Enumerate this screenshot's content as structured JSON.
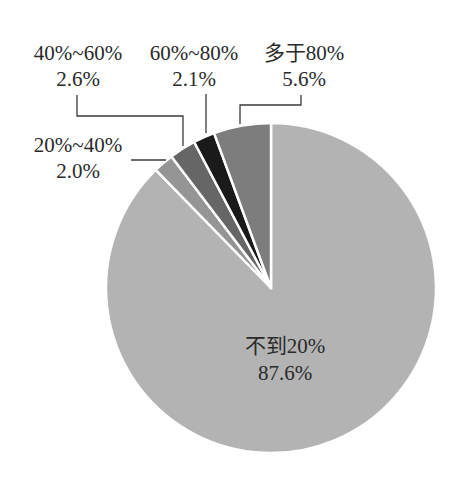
{
  "chart_data": {
    "type": "pie",
    "title": "",
    "start_angle_deg": 0,
    "direction": "clockwise",
    "categories": [
      "不到20%",
      "20%~40%",
      "40%~60%",
      "60%~80%",
      "多于80%"
    ],
    "values": [
      87.6,
      2.0,
      2.6,
      2.1,
      5.6
    ],
    "value_labels": [
      "87.6%",
      "2.0%",
      "2.6%",
      "2.1%",
      "5.6%"
    ],
    "colors": [
      "#b3b3b3",
      "#959595",
      "#666666",
      "#1a1a1a",
      "#7d7d7d"
    ],
    "legend": "none",
    "data_labels": "category and percent"
  },
  "labels": {
    "lt20": {
      "name": "不到20%",
      "pct": "87.6%"
    },
    "r20_40": {
      "name": "20%~40%",
      "pct": "2.0%"
    },
    "r40_60": {
      "name": "40%~60%",
      "pct": "2.6%"
    },
    "r60_80": {
      "name": "60%~80%",
      "pct": "2.1%"
    },
    "gt80": {
      "name": "多于80%",
      "pct": "5.6%"
    }
  }
}
